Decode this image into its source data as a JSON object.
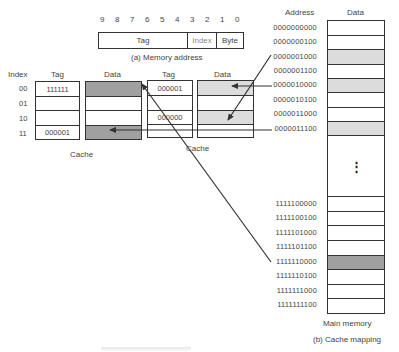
{
  "memory_address": {
    "bits": [
      "9",
      "8",
      "7",
      "6",
      "5",
      "4",
      "3",
      "2",
      "1",
      "0"
    ],
    "fields": [
      {
        "label": "Tag",
        "bits": "9-4"
      },
      {
        "label": "Index",
        "bits": "3-2"
      },
      {
        "label": "Byte",
        "bits": "1-0"
      }
    ],
    "caption": "(a) Memory address"
  },
  "cache_left": {
    "index_header": "Index",
    "tag_header": "Tag",
    "data_header": "Data",
    "label": "Cache",
    "rows": [
      {
        "index": "00",
        "tag": "111111",
        "data_shade": "dark"
      },
      {
        "index": "01",
        "tag": "",
        "data_shade": "none"
      },
      {
        "index": "10",
        "tag": "",
        "data_shade": "none"
      },
      {
        "index": "11",
        "tag": "000001",
        "data_shade": "dark"
      }
    ]
  },
  "cache_right": {
    "tag_header": "Tag",
    "data_header": "Data",
    "label": "Cache",
    "rows": [
      {
        "tag": "000001",
        "data_shade": "light"
      },
      {
        "tag": "",
        "data_shade": "none"
      },
      {
        "tag": "000000",
        "data_shade": "light"
      },
      {
        "tag": "",
        "data_shade": "none"
      }
    ]
  },
  "main_memory": {
    "address_header": "Address",
    "data_header": "Data",
    "label": "Main memory",
    "caption": "(b) Cache mapping",
    "ellipsis": "⋮",
    "top_rows": [
      {
        "address": "0000000000",
        "shade": "none"
      },
      {
        "address": "0000000100",
        "shade": "none"
      },
      {
        "address": "0000001000",
        "shade": "light"
      },
      {
        "address": "0000001100",
        "shade": "none"
      },
      {
        "address": "0000010000",
        "shade": "light"
      },
      {
        "address": "0000010100",
        "shade": "none"
      },
      {
        "address": "0000011000",
        "shade": "none"
      },
      {
        "address": "0000011100",
        "shade": "light"
      }
    ],
    "bottom_rows": [
      {
        "address": "1111100000",
        "shade": "none"
      },
      {
        "address": "1111100100",
        "shade": "none"
      },
      {
        "address": "1111101000",
        "shade": "none"
      },
      {
        "address": "1111101100",
        "shade": "none"
      },
      {
        "address": "1111110000",
        "shade": "dark"
      },
      {
        "address": "1111110100",
        "shade": "none"
      },
      {
        "address": "1111111000",
        "shade": "none"
      },
      {
        "address": "1111111100",
        "shade": "none"
      }
    ]
  },
  "mappings": [
    {
      "from": "0000001000",
      "to": "cache_right.data.2"
    },
    {
      "from": "0000010000",
      "to": "cache_right.data.0"
    },
    {
      "from": "0000011100",
      "to": "cache_left.data.3"
    },
    {
      "from": "1111110000",
      "to": "cache_left.data.0"
    }
  ],
  "colors": {
    "line": "#333333",
    "shade_light": "#dcdcdc",
    "shade_dark": "#a0a0a0"
  }
}
